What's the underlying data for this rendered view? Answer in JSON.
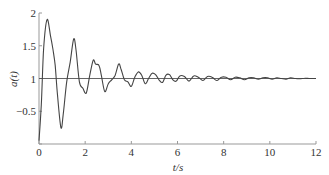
{
  "chart_data": {
    "type": "line",
    "title": "",
    "xlabel": "t/s",
    "ylabel": "a(t)",
    "xlim": [
      0,
      12
    ],
    "ylim": [
      0,
      2
    ],
    "grid": false,
    "x_ticks": [
      0,
      2,
      4,
      6,
      8,
      10,
      12
    ],
    "x_tick_labels": [
      "0",
      "2",
      "4",
      "6",
      "8",
      "10",
      "12"
    ],
    "y_ticks": [
      0,
      0.5,
      1,
      1.5,
      2
    ],
    "y_tick_labels": [
      "0",
      "−0.5",
      "1",
      "1.5",
      "2"
    ],
    "reference_line": {
      "y": 1
    },
    "series": [
      {
        "name": "a(t)",
        "color": "#444444",
        "x": [
          0,
          0.1,
          0.2,
          0.35,
          0.5,
          0.6,
          0.7,
          0.8,
          0.95,
          1.05,
          1.2,
          1.35,
          1.5,
          1.6,
          1.75,
          1.9,
          2.05,
          2.2,
          2.35,
          2.45,
          2.6,
          2.7,
          2.85,
          3.0,
          3.15,
          3.3,
          3.45,
          3.55,
          3.7,
          3.85,
          4.0,
          4.15,
          4.3,
          4.45,
          4.6,
          4.75,
          4.9,
          5.05,
          5.2,
          5.35,
          5.5,
          5.65,
          5.8,
          5.95,
          6.1,
          6.3,
          6.5,
          6.7,
          6.9,
          7.1,
          7.3,
          7.5,
          7.7,
          7.9,
          8.1,
          8.3,
          8.5,
          8.7,
          8.9,
          9.1,
          9.3,
          9.5,
          9.7,
          9.9,
          10.1,
          10.3,
          10.5,
          10.7,
          10.9,
          11.1,
          11.3,
          11.5,
          11.7,
          11.9,
          12.0
        ],
        "values": [
          0.05,
          0.6,
          1.45,
          1.9,
          1.65,
          1.45,
          1.2,
          0.75,
          0.25,
          0.45,
          0.95,
          1.25,
          1.6,
          1.45,
          0.95,
          0.85,
          0.78,
          1.05,
          1.28,
          1.22,
          1.2,
          1.05,
          0.8,
          0.92,
          0.98,
          1.05,
          1.22,
          1.15,
          0.98,
          0.95,
          0.88,
          1.02,
          1.1,
          1.05,
          0.92,
          1.0,
          1.08,
          1.06,
          0.98,
          0.94,
          1.05,
          1.06,
          0.98,
          0.96,
          1.04,
          1.03,
          0.96,
          1.04,
          1.02,
          0.97,
          1.03,
          1.02,
          0.97,
          1.02,
          1.02,
          0.98,
          1.02,
          1.01,
          0.98,
          1.01,
          1.01,
          0.99,
          1.01,
          1.01,
          0.99,
          1.01,
          1.0,
          0.99,
          1.01,
          1.0,
          0.995,
          1.005,
          1.0,
          1.0,
          1.0
        ]
      }
    ]
  }
}
